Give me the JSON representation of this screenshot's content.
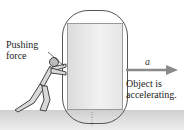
{
  "diagram": {
    "labels": {
      "pushing_force_line1": "Pushing",
      "pushing_force_line2": "force",
      "acceleration_symbol": "a⃗",
      "object_line1": "Object is",
      "object_line2": "accelerating."
    },
    "colors": {
      "arrow": "#8a8a8a",
      "outline": "#555555",
      "ground": "#d4d4d4",
      "box": "#e8e8e8"
    }
  }
}
